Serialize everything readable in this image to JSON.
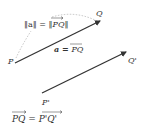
{
  "diagram": {
    "type": "vector-equality",
    "points": {
      "P": {
        "label": "P",
        "x": 14,
        "y": 63
      },
      "Q": {
        "label": "Q",
        "x": 100,
        "y": 20
      },
      "P_prime": {
        "label": "P'",
        "x": 42,
        "y": 94
      },
      "Q_prime": {
        "label": "Q'",
        "x": 126,
        "y": 53
      }
    },
    "labels": {
      "norm_eq_left": "‖a‖ = ‖",
      "norm_eq_vec": "PQ",
      "norm_eq_right": "‖",
      "vec_def_left": "a = ",
      "vec_def_vec": "PQ",
      "bottom_eq_left": "PQ",
      "bottom_eq_mid": " = ",
      "bottom_eq_right": "P'Q'"
    },
    "colors": {
      "vector": "#333333",
      "dashed": "#999999",
      "text": "#333333"
    }
  }
}
